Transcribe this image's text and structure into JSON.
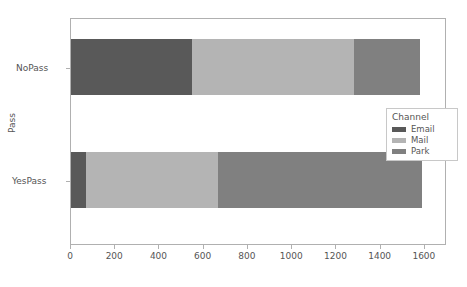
{
  "chart_data": {
    "type": "bar",
    "orientation": "horizontal",
    "stacked": true,
    "title": "",
    "xlabel": "",
    "ylabel": "Pass",
    "categories": [
      "NoPass",
      "YesPass"
    ],
    "series": [
      {
        "name": "Email",
        "color": "#595959",
        "values": [
          545,
          70
        ]
      },
      {
        "name": "Mail",
        "color": "#b4b4b4",
        "values": [
          735,
          594
        ]
      },
      {
        "name": "Park",
        "color": "#808080",
        "values": [
          298,
          922
        ]
      }
    ],
    "cumulative": {
      "NoPass": [
        545,
        1280,
        1578
      ],
      "YesPass": [
        70,
        664,
        1586
      ]
    },
    "totals": {
      "NoPass": 1578,
      "YesPass": 1586
    },
    "xlim": [
      0,
      1700
    ],
    "xticks": [
      0,
      200,
      400,
      600,
      800,
      1000,
      1200,
      1400,
      1600
    ],
    "xtick_labels": [
      "0",
      "200",
      "400",
      "600",
      "800",
      "1000",
      "1200",
      "1400",
      "1600"
    ],
    "grid": false,
    "legend": {
      "title": "Channel",
      "position": "center-right",
      "entries": [
        {
          "label": "Email",
          "color": "#595959"
        },
        {
          "label": "Mail",
          "color": "#b4b4b4"
        },
        {
          "label": "Park",
          "color": "#808080"
        }
      ]
    }
  },
  "axes": {
    "y_title": "Pass",
    "y_ticks": [
      "NoPass",
      "YesPass"
    ],
    "x_ticks": [
      "0",
      "200",
      "400",
      "600",
      "800",
      "1000",
      "1200",
      "1400",
      "1600"
    ]
  },
  "legend": {
    "title": "Channel",
    "items": [
      {
        "label": "Email"
      },
      {
        "label": "Mail"
      },
      {
        "label": "Park"
      }
    ]
  },
  "caption": {
    "text": ""
  }
}
